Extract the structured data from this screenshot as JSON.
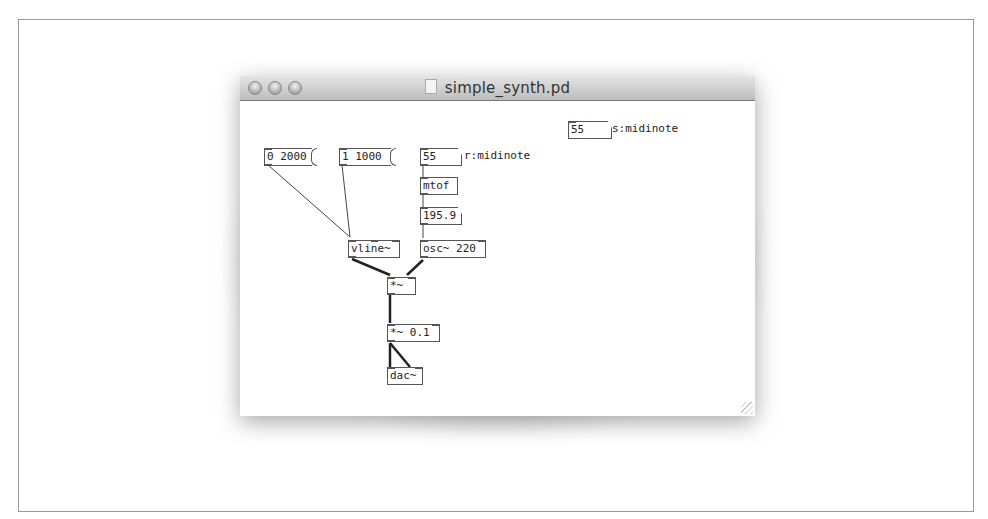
{
  "window": {
    "title": "simple_synth.pd",
    "traffic_lights": [
      "close",
      "minimize",
      "zoom"
    ]
  },
  "patch": {
    "send_atom": {
      "value": "55",
      "label": "s:midinote"
    },
    "messages": [
      {
        "id": "msg1",
        "text": "0 2000"
      },
      {
        "id": "msg2",
        "text": "1 1000"
      }
    ],
    "receive_atom": {
      "value": "55",
      "label": "r:midinote"
    },
    "objects": {
      "mtof": "mtof",
      "freq_atom": "195.9",
      "vline": "vline~",
      "osc": "osc~ 220",
      "mul": "*~",
      "mul_gain": "*~ 0.1",
      "dac": "dac~"
    }
  }
}
